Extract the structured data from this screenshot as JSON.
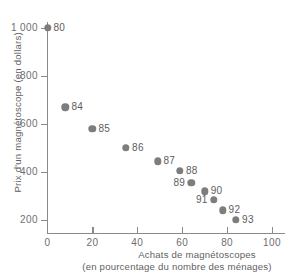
{
  "chart_data": {
    "type": "scatter",
    "title": "",
    "xlabel": "Achats de magnétoscopes (en pourcentage du nombre des ménages)",
    "ylabel": "Prix d'un magnétoscope (en dollars)",
    "xlim": [
      0,
      106
    ],
    "ylim": [
      140,
      1030
    ],
    "grid": false,
    "legend": "none",
    "x_ticks": [
      "0",
      "20",
      "40",
      "60",
      "80",
      "100"
    ],
    "y_ticks": [
      "200",
      "400",
      "600",
      "800",
      "1 000"
    ],
    "x_tick_values": [
      0,
      20,
      40,
      60,
      80,
      100
    ],
    "y_tick_values": [
      200,
      400,
      600,
      800,
      1000
    ],
    "point_color": "#7d7d7d",
    "axis_color": "#8a8a8a",
    "points": [
      {
        "label": "80",
        "x": 0,
        "y": 1000,
        "label_side": "right"
      },
      {
        "label": "84",
        "x": 8,
        "y": 670,
        "label_side": "right"
      },
      {
        "label": "85",
        "x": 20,
        "y": 580,
        "label_side": "right"
      },
      {
        "label": "86",
        "x": 35,
        "y": 500,
        "label_side": "right"
      },
      {
        "label": "87",
        "x": 49,
        "y": 445,
        "label_side": "right"
      },
      {
        "label": "88",
        "x": 59,
        "y": 405,
        "label_side": "right"
      },
      {
        "label": "89",
        "x": 64,
        "y": 355,
        "label_side": "left"
      },
      {
        "label": "90",
        "x": 70,
        "y": 320,
        "label_side": "right"
      },
      {
        "label": "91",
        "x": 74,
        "y": 285,
        "label_side": "left"
      },
      {
        "label": "92",
        "x": 78,
        "y": 240,
        "label_side": "right"
      },
      {
        "label": "93",
        "x": 84,
        "y": 200,
        "label_side": "right"
      }
    ]
  },
  "axes": {
    "y_title": "Prix d'un magnétoscope (en dollars)",
    "x_title_line1": "Achats de magnétoscopes",
    "x_title_line2": "(en pourcentage du nombre des ménages)"
  }
}
